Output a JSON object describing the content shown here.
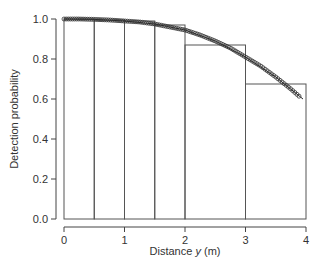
{
  "chart_data": {
    "type": "bar",
    "title": "",
    "xlabel": "Distance y (m)",
    "xlabel_parts": {
      "pre": "Distance ",
      "italic": "y",
      "post": " (m)"
    },
    "ylabel": "Detection probability",
    "xlim": [
      0,
      4
    ],
    "ylim": [
      0,
      1.0
    ],
    "x_ticks": [
      "0",
      "1",
      "2",
      "3",
      "4"
    ],
    "y_ticks": [
      "0.0",
      "0.2",
      "0.4",
      "0.6",
      "0.8",
      "1.0"
    ],
    "grid": false,
    "histogram_bins": [
      {
        "from": 0.0,
        "to": 0.5,
        "height": 1.0
      },
      {
        "from": 0.5,
        "to": 1.0,
        "height": 0.995
      },
      {
        "from": 1.0,
        "to": 1.5,
        "height": 0.99
      },
      {
        "from": 1.5,
        "to": 2.0,
        "height": 0.97
      },
      {
        "from": 2.0,
        "to": 3.0,
        "height": 0.87
      },
      {
        "from": 3.0,
        "to": 4.0,
        "height": 0.675
      }
    ],
    "series": [
      {
        "name": "detection function (points)",
        "type": "scatter",
        "x": [
          0.0,
          0.25,
          0.5,
          0.75,
          1.0,
          1.25,
          1.5,
          1.75,
          2.0,
          2.25,
          2.5,
          2.75,
          3.0,
          3.25,
          3.5,
          3.75,
          3.9
        ],
        "y": [
          1.0,
          1.0,
          0.998,
          0.995,
          0.99,
          0.985,
          0.975,
          0.96,
          0.945,
          0.92,
          0.89,
          0.855,
          0.81,
          0.765,
          0.71,
          0.65,
          0.61
        ]
      },
      {
        "name": "fitted half-normal curve",
        "type": "line",
        "x": [
          0.0,
          0.5,
          1.0,
          1.5,
          2.0,
          2.5,
          3.0,
          3.5,
          3.95
        ],
        "y": [
          1.0,
          0.998,
          0.99,
          0.975,
          0.945,
          0.89,
          0.81,
          0.71,
          0.6
        ]
      }
    ]
  }
}
